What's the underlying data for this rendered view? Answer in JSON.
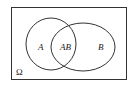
{
  "diagram": {
    "type": "venn",
    "universe_label": "Ω",
    "sets": [
      {
        "name": "A",
        "label": "A"
      },
      {
        "name": "B",
        "label": "B"
      }
    ],
    "intersection_label": "AB",
    "stroke_color": "#333333",
    "background": "#ffffff"
  }
}
